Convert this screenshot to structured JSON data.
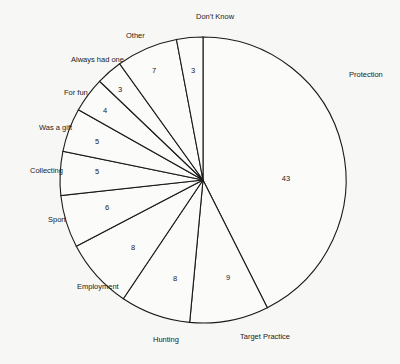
{
  "chart_data": {
    "type": "pie",
    "title": "",
    "start_angle_deg": 0,
    "direction": "clockwise",
    "categories": [
      "Protection",
      "Target Practice",
      "Hunting",
      "Employment",
      "Sport",
      "Collecting",
      "Was a gift",
      "For fun",
      "Always had one",
      "Other",
      "Don't Know"
    ],
    "values": [
      43,
      9,
      8,
      8,
      6,
      5,
      5,
      4,
      3,
      7,
      3
    ],
    "slices": [
      {
        "label": "Protection",
        "value": 43,
        "label_pos": [
          349,
          77
        ],
        "value_pos": [
          286,
          181
        ]
      },
      {
        "label": "Target Practice",
        "value": 9,
        "label_pos": [
          240,
          339
        ],
        "value_pos": [
          228,
          280
        ]
      },
      {
        "label": "Hunting",
        "value": 8,
        "label_pos": [
          153,
          342
        ],
        "value_pos": [
          175,
          281
        ]
      },
      {
        "label": "Employment",
        "value": 8,
        "label_pos": [
          77,
          289
        ],
        "value_pos": [
          133,
          250
        ]
      },
      {
        "label": "Sport",
        "value": 6,
        "label_pos": [
          48,
          222
        ],
        "value_pos": [
          107,
          210
        ]
      },
      {
        "label": "Collecting",
        "value": 5,
        "label_pos": [
          30,
          173
        ],
        "value_pos": [
          97,
          174
        ]
      },
      {
        "label": "Was a gift",
        "value": 5,
        "label_pos": [
          39,
          130
        ],
        "value_pos": [
          97,
          144
        ]
      },
      {
        "label": "For fun",
        "value": 4,
        "label_pos": [
          64,
          95
        ],
        "value_pos": [
          105,
          113
        ]
      },
      {
        "label": "Always had one",
        "value": 3,
        "label_pos": [
          71,
          62
        ],
        "value_pos": [
          120,
          92
        ]
      },
      {
        "label": "Other",
        "value": 7,
        "label_pos": [
          126,
          38
        ],
        "value_pos": [
          154,
          73
        ]
      },
      {
        "label": "Don't Know",
        "value": 3,
        "label_pos": [
          196,
          19
        ],
        "value_pos": [
          193,
          73
        ]
      }
    ],
    "legend": "none (direct labels)"
  }
}
